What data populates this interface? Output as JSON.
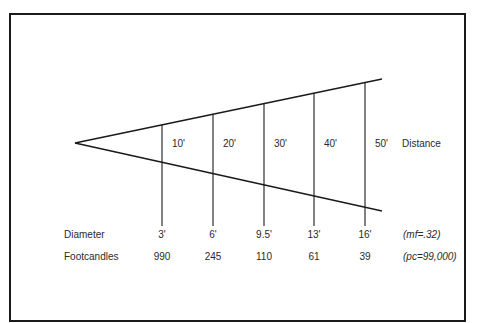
{
  "diagram": {
    "type": "light-beam-cone",
    "apex": {
      "x": 75,
      "y": 143
    },
    "upper_edge_end": {
      "x": 382,
      "y": 79
    },
    "lower_edge_end": {
      "x": 382,
      "y": 211
    },
    "stations": [
      {
        "distance": "10'",
        "diameter": "3'",
        "footcandles": "990",
        "x": 162
      },
      {
        "distance": "20'",
        "diameter": "6'",
        "footcandles": "245",
        "x": 213
      },
      {
        "distance": "30'",
        "diameter": "9.5'",
        "footcandles": "110",
        "x": 264
      },
      {
        "distance": "40'",
        "diameter": "13'",
        "footcandles": "61",
        "x": 314
      },
      {
        "distance": "50'",
        "diameter": "16'",
        "footcandles": "39",
        "x": 365
      }
    ],
    "labels": {
      "distance": "Distance",
      "diameter": "Diameter",
      "footcandles": "Footcandles",
      "multiplying_factor": "(mf=.32)",
      "peak_candela": "(pc=99,000)"
    }
  }
}
